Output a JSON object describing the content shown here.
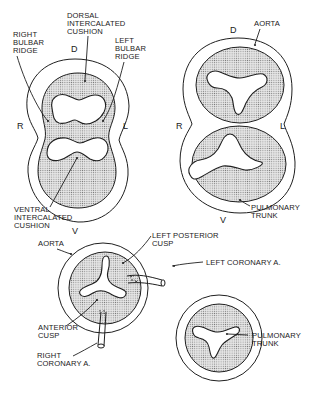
{
  "figure": {
    "panels": [
      {
        "id": "panel-a",
        "description": "Truncus with bulbar ridges and intercalated cushions (undivided)",
        "orientation": {
          "top": "D",
          "right": "L",
          "bottom": "V",
          "left": "R"
        },
        "labels": [
          {
            "key": "dorsal_cushion",
            "lines": [
              "DORSAL",
              "INTERCALATED",
              "CUSHION"
            ]
          },
          {
            "key": "right_ridge",
            "lines": [
              "RIGHT",
              "BULBAR",
              "RIDGE"
            ]
          },
          {
            "key": "left_ridge",
            "lines": [
              "LEFT",
              "BULBAR",
              "RIDGE"
            ]
          },
          {
            "key": "ventral_cushion",
            "lines": [
              "VENTRAL",
              "INTERCALATED",
              "CUSHION"
            ]
          }
        ]
      },
      {
        "id": "panel-b",
        "description": "Separated aorta and pulmonary trunk",
        "orientation": {
          "top": "D",
          "right": "L",
          "bottom": "V",
          "left": "R"
        },
        "labels": [
          {
            "key": "aorta",
            "lines": [
              "AORTA"
            ]
          },
          {
            "key": "pulmonary_trunk",
            "lines": [
              "PULMONARY",
              "TRUNK"
            ]
          }
        ]
      },
      {
        "id": "panel-c",
        "description": "Aortic valve cusps with coronary arteries; pulmonary trunk",
        "labels": [
          {
            "key": "aorta",
            "lines": [
              "AORTA"
            ]
          },
          {
            "key": "left_posterior_cusp",
            "lines": [
              "LEFT POSTERIOR",
              "CUSP"
            ]
          },
          {
            "key": "left_coronary",
            "lines": [
              "LEFT CORONARY A."
            ]
          },
          {
            "key": "anterior_cusp",
            "lines": [
              "ANTERIOR",
              "CUSP"
            ]
          },
          {
            "key": "right_coronary",
            "lines": [
              "RIGHT",
              "CORONARY A."
            ]
          },
          {
            "key": "pulmonary_trunk",
            "lines": [
              "PULMONARY",
              "TRUNK"
            ]
          }
        ]
      }
    ]
  },
  "a": {
    "D": "D",
    "L": "L",
    "V": "V",
    "R": "R",
    "dorsal_1": "DORSAL",
    "dorsal_2": "INTERCALATED",
    "dorsal_3": "CUSHION",
    "right_1": "RIGHT",
    "right_2": "BULBAR",
    "right_3": "RIDGE",
    "left_1": "LEFT",
    "left_2": "BULBAR",
    "left_3": "RIDGE",
    "ventral_1": "VENTRAL",
    "ventral_2": "INTERCALATED",
    "ventral_3": "CUSHION"
  },
  "b": {
    "D": "D",
    "L": "L",
    "V": "V",
    "R": "R",
    "aorta": "AORTA",
    "pulm_1": "PULMONARY",
    "pulm_2": "TRUNK"
  },
  "c": {
    "aorta": "AORTA",
    "lpc_1": "LEFT POSTERIOR",
    "lpc_2": "CUSP",
    "lca": "LEFT CORONARY A.",
    "ant_1": "ANTERIOR",
    "ant_2": "CUSP",
    "rca_1": "RIGHT",
    "rca_2": "CORONARY A.",
    "pulm_1": "PULMONARY",
    "pulm_2": "TRUNK"
  },
  "colors": {
    "line": "#1f1f1f",
    "stipple_dot": "#6e6e6e",
    "background": "#ffffff"
  }
}
